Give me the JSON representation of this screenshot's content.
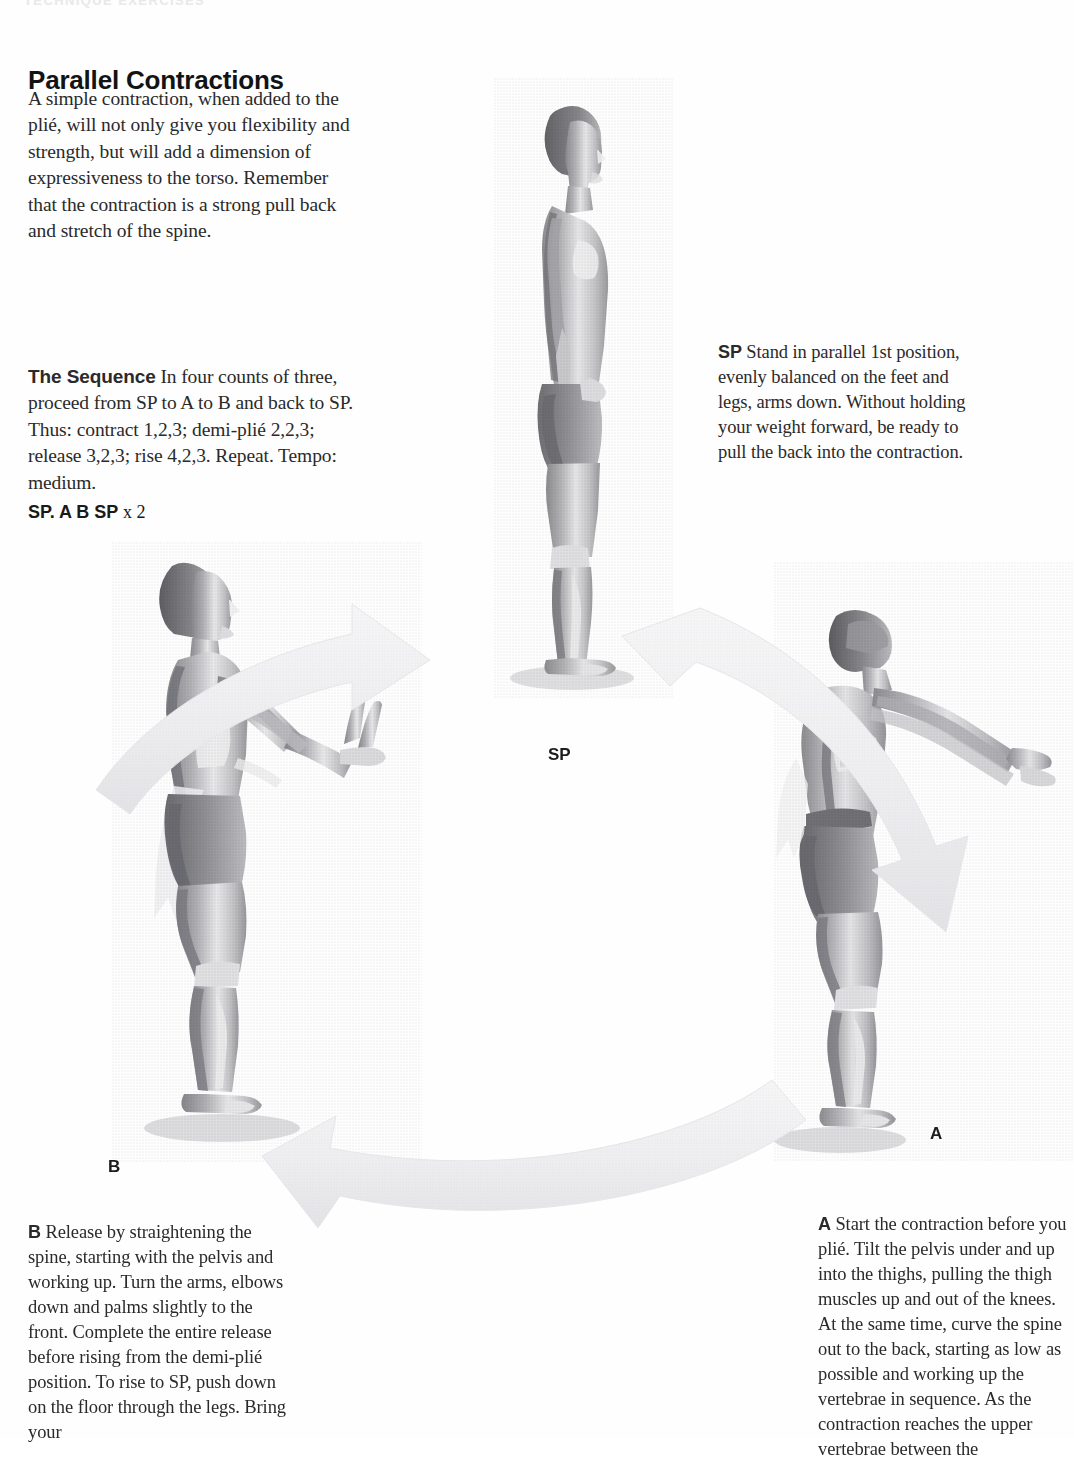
{
  "page": {
    "running_head": "TECHNIQUE EXERCISES",
    "background_color": "#ffffff",
    "text_color": "#2a2a2a"
  },
  "header": {
    "title": "Parallel Contractions",
    "intro": "A simple contraction, when added to the plié, will not only give you flexibility and strength, but will add a dimension of expressiveness to the torso. Remember that the contraction is a strong pull back and stretch of the spine."
  },
  "sequence": {
    "lead": "The Sequence",
    "body": " In four counts of three, proceed from SP to A to B and back to SP. Thus: contract 1,2,3; demi-plié 2,2,3; release 3,2,3; rise 4,2,3. Repeat. Tempo: medium.",
    "code_bold": "SP. A B SP",
    "code_rest": " x 2"
  },
  "captions": {
    "sp": {
      "lead": "SP",
      "body": " Stand in parallel 1st position, evenly balanced on the feet and legs, arms down. Without holding your weight forward, be ready to pull the back into the contraction."
    },
    "a": {
      "lead": "A",
      "body": " Start the contraction before you plié. Tilt the pelvis under and up into the thighs, pulling the thigh muscles up and out of the knees. At the same time, curve the spine out to the back, starting as low as possible and working up the vertebrae in sequence. As the contraction reaches the upper vertebrae between the"
    },
    "b": {
      "lead": "B",
      "body": " Release by straightening the spine, starting with the pelvis and working up. Turn the arms, elbows down and palms slightly to the front. Complete the entire release before rising from the demi-plié position. To rise to SP, push down on the floor through the legs. Bring your"
    }
  },
  "labels": {
    "sp": "SP",
    "a": "A",
    "b": "B"
  },
  "figures": [
    {
      "name": "figure-sp",
      "pose": "standing-profile-parallel-first-position",
      "alt": "Dancer standing upright in profile, parallel first position, arms down"
    },
    {
      "name": "figure-b",
      "pose": "demi-plie-release-arms-forward",
      "alt": "Dancer in demi-plié facing right, spine straightened, arms raised forward with palms front"
    },
    {
      "name": "figure-a",
      "pose": "contraction-back-curved-arms-extended",
      "alt": "Dancer seen from the back in contraction, spine curved out, arms extended forward"
    }
  ],
  "arrows": [
    {
      "name": "arrow-b-to-sp",
      "from": "B",
      "to": "SP",
      "direction": "right-up"
    },
    {
      "name": "arrow-sp-to-a",
      "from": "SP",
      "to": "A",
      "direction": "right-down"
    },
    {
      "name": "arrow-a-to-b",
      "from": "A",
      "to": "B",
      "direction": "left"
    }
  ],
  "colors": {
    "ink": "#1a1a1a",
    "body_text": "#2a2a2a",
    "arrow_fill": "#f1f1f2",
    "arrow_stroke": "#e2e2e4",
    "halftone_dark": "#6f6f71",
    "halftone_mid": "#9e9ea1",
    "halftone_light": "#cfcfd2"
  }
}
